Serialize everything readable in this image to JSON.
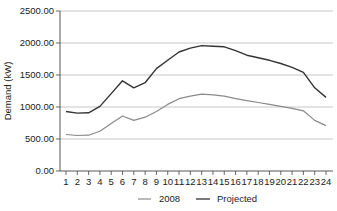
{
  "chart_data": {
    "type": "line",
    "title": "",
    "xlabel": "",
    "ylabel": "Demand (kW)",
    "ylim": [
      0,
      2500
    ],
    "yticks": [
      "0.00",
      "500.00",
      "1000.00",
      "1500.00",
      "2000.00",
      "2500.00"
    ],
    "x": [
      1,
      2,
      3,
      4,
      5,
      6,
      7,
      8,
      9,
      10,
      11,
      12,
      13,
      14,
      15,
      16,
      17,
      18,
      19,
      20,
      21,
      22,
      23,
      24
    ],
    "grid": true,
    "legend_position": "bottom",
    "series": [
      {
        "name": "2008",
        "color": "#8a8a8a",
        "values": [
          570,
          555,
          560,
          620,
          740,
          860,
          790,
          840,
          930,
          1040,
          1130,
          1170,
          1200,
          1190,
          1170,
          1130,
          1100,
          1070,
          1040,
          1010,
          980,
          940,
          790,
          710
        ]
      },
      {
        "name": "Projected",
        "color": "#333333",
        "values": [
          930,
          905,
          910,
          1010,
          1210,
          1410,
          1300,
          1380,
          1600,
          1730,
          1860,
          1920,
          1960,
          1950,
          1940,
          1880,
          1810,
          1770,
          1730,
          1680,
          1620,
          1540,
          1300,
          1150
        ]
      }
    ]
  },
  "legend": {
    "items": [
      {
        "label": "2008"
      },
      {
        "label": "Projected"
      }
    ]
  }
}
